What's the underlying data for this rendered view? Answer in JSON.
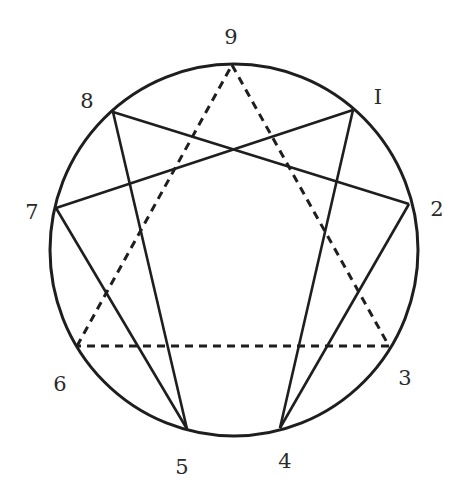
{
  "diagram": {
    "type": "enneagram",
    "stroke_color": "#1e1e1e",
    "label_color": "#2a2a2a",
    "circle": {
      "cx": 234,
      "cy": 250,
      "rx": 184,
      "ry": 186
    },
    "points": [
      {
        "id": "9",
        "label": "9",
        "x": 232,
        "y": 65,
        "lx": 231,
        "ly": 44
      },
      {
        "id": "1",
        "label": "I",
        "x": 353,
        "y": 110,
        "lx": 378,
        "ly": 104
      },
      {
        "id": "2",
        "label": "2",
        "x": 409,
        "y": 204,
        "lx": 437,
        "ly": 216
      },
      {
        "id": "3",
        "label": "3",
        "x": 389,
        "y": 346,
        "lx": 405,
        "ly": 385
      },
      {
        "id": "4",
        "label": "4",
        "x": 280,
        "y": 428,
        "lx": 285,
        "ly": 468
      },
      {
        "id": "5",
        "label": "5",
        "x": 187,
        "y": 429,
        "lx": 182,
        "ly": 474
      },
      {
        "id": "6",
        "label": "6",
        "x": 77,
        "y": 346,
        "lx": 60,
        "ly": 391
      },
      {
        "id": "7",
        "label": "7",
        "x": 56,
        "y": 208,
        "lx": 32,
        "ly": 219
      },
      {
        "id": "8",
        "label": "8",
        "x": 113,
        "y": 112,
        "lx": 87,
        "ly": 108
      }
    ],
    "solid_lines": [
      [
        "1",
        "4"
      ],
      [
        "4",
        "2"
      ],
      [
        "2",
        "8"
      ],
      [
        "8",
        "5"
      ],
      [
        "5",
        "7"
      ],
      [
        "7",
        "1"
      ]
    ],
    "dashed_lines": [
      [
        "9",
        "3"
      ],
      [
        "3",
        "6"
      ],
      [
        "6",
        "9"
      ]
    ]
  }
}
